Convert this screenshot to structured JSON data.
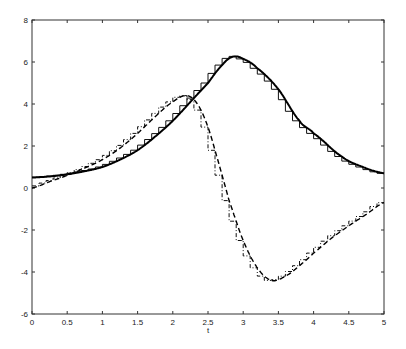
{
  "chart_data": {
    "type": "line",
    "title": "",
    "xlabel": "t",
    "ylabel": "",
    "xlim": [
      0,
      5
    ],
    "ylim": [
      -6,
      8
    ],
    "grid": false,
    "legend": null,
    "x_ticks": [
      "0",
      "0.5",
      "1",
      "1.5",
      "2",
      "2.5",
      "3",
      "3.5",
      "4",
      "4.5",
      "5"
    ],
    "y_ticks": [
      "-6",
      "-4",
      "-2",
      "0",
      "2",
      "4",
      "6",
      "8"
    ],
    "series": [
      {
        "name": "solid smooth curve",
        "style": "solid",
        "x": [
          0,
          0.25,
          0.5,
          0.75,
          1.0,
          1.25,
          1.5,
          1.75,
          2.0,
          2.25,
          2.5,
          2.7,
          2.85,
          3.0,
          3.2,
          3.5,
          3.8,
          4.0,
          4.4,
          4.7,
          5.0
        ],
        "y": [
          0.5,
          0.55,
          0.65,
          0.8,
          1.0,
          1.35,
          1.8,
          2.45,
          3.2,
          4.1,
          5.0,
          5.85,
          6.25,
          6.15,
          5.7,
          4.7,
          3.2,
          2.6,
          1.5,
          1.0,
          0.7
        ]
      },
      {
        "name": "solid staircase approximation",
        "style": "staircase",
        "step": 0.1,
        "follows": "solid smooth curve"
      },
      {
        "name": "dashed smooth curve",
        "style": "dashed",
        "x": [
          0,
          0.25,
          0.5,
          0.75,
          1.0,
          1.25,
          1.5,
          1.75,
          2.0,
          2.2,
          2.35,
          2.5,
          2.65,
          2.8,
          3.0,
          3.2,
          3.4,
          3.6,
          3.8,
          4.0,
          4.25,
          4.5,
          4.75,
          5.0
        ],
        "y": [
          0.0,
          0.3,
          0.6,
          0.95,
          1.35,
          1.9,
          2.6,
          3.4,
          4.1,
          4.4,
          4.0,
          2.9,
          1.2,
          -0.6,
          -2.5,
          -3.8,
          -4.4,
          -4.2,
          -3.7,
          -3.1,
          -2.4,
          -1.8,
          -1.25,
          -0.7
        ]
      },
      {
        "name": "dashed staircase approximation",
        "style": "dashdot-staircase",
        "step": 0.1,
        "follows": "dashed smooth curve"
      }
    ]
  }
}
